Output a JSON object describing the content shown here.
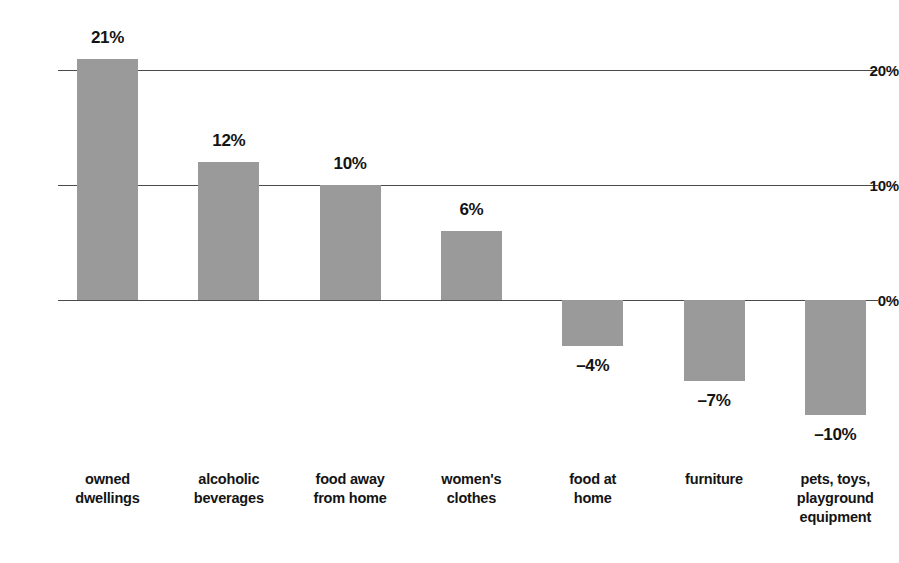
{
  "chart_data": {
    "type": "bar",
    "title": "",
    "subtitle": "",
    "xlabel": "",
    "ylabel": "",
    "categories": [
      "owned\ndwellings",
      "alcoholic\nbeverages",
      "food away\nfrom home",
      "women's\nclothes",
      "food at\nhome",
      "furniture",
      "pets, toys,\nplayground\nequipment"
    ],
    "values": [
      21,
      12,
      10,
      6,
      -4,
      -7,
      -10
    ],
    "value_labels": [
      "21%",
      "12%",
      "10%",
      "6%",
      "–4%",
      "–7%",
      "–10%"
    ],
    "ylim": [
      -12,
      23
    ],
    "yticks": [
      0,
      10,
      20
    ],
    "ytick_labels": [
      "0%",
      "10%",
      "20%"
    ],
    "grid": true,
    "legend": "none",
    "bar_color": "#9a9a9a",
    "text_color": "#141414",
    "axis_color": "#4a4a4a",
    "background": "#ffffff"
  }
}
